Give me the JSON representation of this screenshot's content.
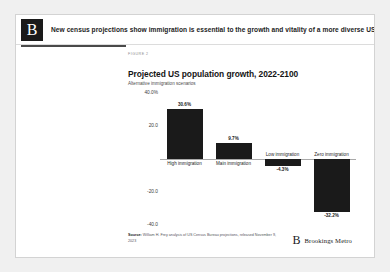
{
  "masthead": {
    "logo_letter": "B",
    "logo_icon": "brookings-b-logo-icon",
    "headline": "New census projections show immigration is essential to the growth and vitality of a more diverse US population"
  },
  "figure": {
    "kicker": "FIGURE 2",
    "title": "Projected US population growth, 2022-2100",
    "subtitle": "Alternative immigration scenarios",
    "source": "Source: William H. Frey analysis of US Census Bureau projections, released November 9, 2023",
    "source_prefix": "Source:",
    "source_rest": " William H. Frey analysis of US Census Bureau projections, released November 9, 2023",
    "brand_letter": "B",
    "brand_name": "Brookings Metro"
  },
  "chart_data": {
    "type": "bar",
    "title": "Projected US population growth, 2022-2100",
    "subtitle": "Alternative immigration scenarios",
    "xlabel": "",
    "ylabel": "",
    "categories": [
      "High immigration",
      "Main immigration",
      "Low immigration",
      "Zero immigration"
    ],
    "values": [
      30.6,
      9.7,
      -4.3,
      -32.2
    ],
    "value_labels": [
      "30.6%",
      "9.7%",
      "-4.3%",
      "-32.2%"
    ],
    "ylim": [
      -40.0,
      40.0
    ],
    "yticks": [
      40.0,
      20.0,
      -20.0,
      -40.0
    ],
    "ytick_labels": [
      "40.0%",
      "20.0",
      "-20.0",
      "-40.0"
    ],
    "grid": false,
    "legend": false,
    "bar_color": "#1a1a1a",
    "zero_line_color": "#a9a9a9"
  },
  "colors": {
    "page_background": "#f0f0f0",
    "card_background": "#ffffff",
    "card_border": "#d3d3d3",
    "ink": "#1a1a1a"
  }
}
